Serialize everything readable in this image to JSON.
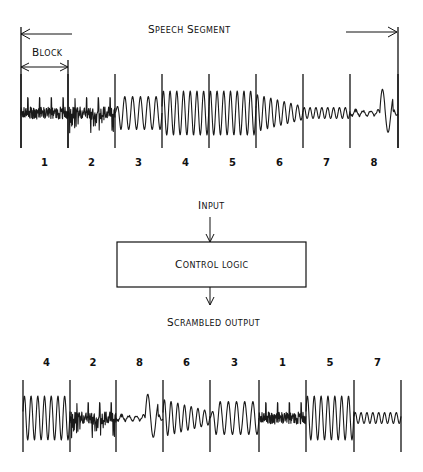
{
  "top": {
    "title": "Speech Segment",
    "block_label": "Block",
    "block_numbers": [
      "1",
      "2",
      "3",
      "4",
      "5",
      "6",
      "7",
      "8"
    ],
    "boundaries_x": [
      21,
      68,
      115,
      162,
      209,
      256,
      303,
      350,
      398
    ]
  },
  "control": {
    "input_label": "Input",
    "box_label": "Control logic",
    "output_label": "Scrambled output"
  },
  "bottom": {
    "block_order": [
      "4",
      "2",
      "8",
      "6",
      "3",
      "1",
      "5",
      "7"
    ],
    "boundaries_x": [
      23,
      70,
      116,
      163,
      210,
      259,
      306,
      354,
      401
    ]
  },
  "block_styles": {
    "1": {
      "type": "noise-pulses",
      "amp": 1.0
    },
    "2": {
      "type": "noise-pulses",
      "amp": 1.0
    },
    "3": {
      "type": "sine",
      "amp": 0.75,
      "cycles": 6
    },
    "4": {
      "type": "sine",
      "amp": 1.0,
      "cycles": 7
    },
    "5": {
      "type": "sine",
      "amp": 1.0,
      "cycles": 7
    },
    "6": {
      "type": "sine-decay",
      "amp": 0.75,
      "cycles": 7
    },
    "7": {
      "type": "sine",
      "amp": 0.25,
      "cycles": 8
    },
    "8": {
      "type": "burst",
      "amp": 1.0
    }
  }
}
